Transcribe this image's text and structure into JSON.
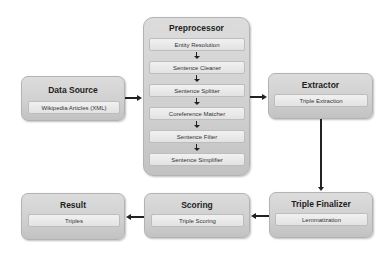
{
  "diagram": {
    "data_source": {
      "title": "Data Source",
      "items": [
        "Wikipedia Articles (XML)"
      ]
    },
    "preprocessor": {
      "title": "Preprocessor",
      "items": [
        "Entity Resolution",
        "Sentence Cleaner",
        "Sentence Splitter",
        "Coreference Matcher",
        "Sentence Filter",
        "Sentence Simplifier"
      ]
    },
    "extractor": {
      "title": "Extractor",
      "items": [
        "Triple Extraction"
      ]
    },
    "triple_finalizer": {
      "title": "Triple Finalizer",
      "items": [
        "Lemmatization"
      ]
    },
    "scoring": {
      "title": "Scoring",
      "items": [
        "Triple Scoring"
      ]
    },
    "result": {
      "title": "Result",
      "items": [
        "Triples"
      ]
    },
    "edges": [
      {
        "from": "Data Source",
        "to": "Preprocessor"
      },
      {
        "from": "Preprocessor",
        "to": "Extractor"
      },
      {
        "from": "Extractor",
        "to": "Triple Finalizer"
      },
      {
        "from": "Triple Finalizer",
        "to": "Scoring"
      },
      {
        "from": "Scoring",
        "to": "Result"
      }
    ]
  }
}
